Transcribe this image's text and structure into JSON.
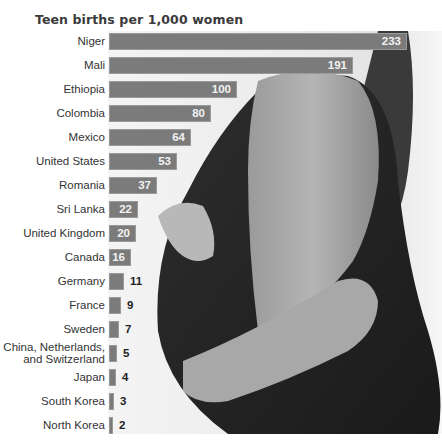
{
  "chart_data": {
    "type": "bar",
    "orientation": "horizontal",
    "title": "Teen births per 1,000 women",
    "xlabel": "",
    "ylabel": "",
    "categories": [
      "Niger",
      "Mali",
      "Ethiopia",
      "Colombia",
      "Mexico",
      "United States",
      "Romania",
      "Sri Lanka",
      "United Kingdom",
      "Canada",
      "Germany",
      "France",
      "Sweden",
      "China, Netherlands, and Switzerland",
      "Japan",
      "South Korea",
      "North Korea"
    ],
    "values": [
      233,
      191,
      100,
      80,
      64,
      53,
      37,
      22,
      20,
      16,
      11,
      9,
      7,
      5,
      4,
      3,
      2
    ],
    "data_labels": true,
    "grid": false,
    "legend": null,
    "background": "grayscale photo of pregnant woman behind bars",
    "bar_color": "#7b7b7b"
  },
  "rows": [
    {
      "label": "Niger",
      "value": "233",
      "width": 298,
      "inside": true
    },
    {
      "label": "Mali",
      "value": "191",
      "width": 244,
      "inside": true
    },
    {
      "label": "Ethiopia",
      "value": "100",
      "width": 128,
      "inside": true
    },
    {
      "label": "Colombia",
      "value": "80",
      "width": 102,
      "inside": true
    },
    {
      "label": "Mexico",
      "value": "64",
      "width": 82,
      "inside": true
    },
    {
      "label": "United States",
      "value": "53",
      "width": 68,
      "inside": true
    },
    {
      "label": "Romania",
      "value": "37",
      "width": 48,
      "inside": true
    },
    {
      "label": "Sri Lanka",
      "value": "22",
      "width": 29,
      "inside": true
    },
    {
      "label": "United Kingdom",
      "value": "20",
      "width": 27,
      "inside": true
    },
    {
      "label": "Canada",
      "value": "16",
      "width": 22,
      "inside": true
    },
    {
      "label": "Germany",
      "value": "11",
      "width": 15,
      "inside": false
    },
    {
      "label": "France",
      "value": "9",
      "width": 12,
      "inside": false
    },
    {
      "label": "Sweden",
      "value": "7",
      "width": 10,
      "inside": false
    },
    {
      "label": "China, Netherlands,\nand Switzerland",
      "value": "5",
      "width": 8,
      "inside": false
    },
    {
      "label": "Japan",
      "value": "4",
      "width": 7,
      "inside": false
    },
    {
      "label": "South Korea",
      "value": "3",
      "width": 5,
      "inside": false
    },
    {
      "label": "North Korea",
      "value": "2",
      "width": 4,
      "inside": false
    }
  ]
}
